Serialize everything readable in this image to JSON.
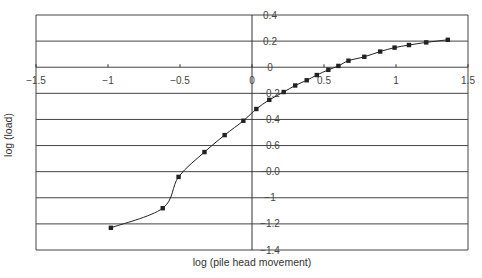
{
  "chart_data": {
    "type": "line",
    "title": "",
    "xlabel": "log (pile head movement)",
    "ylabel": "log (load)",
    "xlim": [
      -1.5,
      1.5
    ],
    "ylim": [
      -1.4,
      0.4
    ],
    "grid": {
      "horizontal": true,
      "vertical": false
    },
    "legend": null,
    "x_ticks": [
      -1.5,
      -1,
      -0.5,
      0,
      0.5,
      1,
      1.5
    ],
    "x_tick_labels": [
      "−1.5",
      "−1",
      "−0.5",
      "0",
      "0.5",
      "1",
      "1.5"
    ],
    "y_ticks": [
      0.4,
      0.2,
      0,
      -0.2,
      -0.4,
      -0.6,
      -0.8,
      -1,
      -1.2,
      -1.4
    ],
    "y_tick_labels": [
      "0.4",
      "0.2",
      "0",
      "−0.2",
      "−0.4",
      "−0.6",
      "−0.0",
      "−1",
      "−1.2",
      "−1.4"
    ],
    "series": [
      {
        "name": "load-movement",
        "marker": "square",
        "color": "#222222",
        "x": [
          -0.98,
          -0.62,
          -0.51,
          -0.33,
          -0.19,
          -0.06,
          0.03,
          0.12,
          0.22,
          0.3,
          0.38,
          0.45,
          0.53,
          0.6,
          0.67,
          0.78,
          0.89,
          0.99,
          1.09,
          1.21,
          1.36
        ],
        "y": [
          -1.23,
          -1.08,
          -0.84,
          -0.65,
          -0.52,
          -0.41,
          -0.32,
          -0.25,
          -0.19,
          -0.14,
          -0.1,
          -0.06,
          -0.02,
          0.01,
          0.05,
          0.08,
          0.12,
          0.15,
          0.17,
          0.19,
          0.21
        ]
      }
    ]
  },
  "layout": {
    "plot_left_px": 36,
    "plot_right_px": 468,
    "plot_top_px": 15,
    "plot_bottom_px": 250,
    "line_color": "#333333",
    "grid_color": "#444444"
  }
}
